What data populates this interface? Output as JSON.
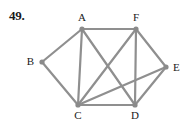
{
  "figure": {
    "number_label": "49.",
    "type": "undirected-graph",
    "width": 185,
    "height": 124,
    "background_color": "#ffffff",
    "edge_color": "#8f8f8f",
    "vertex_color": "#8a8a8a",
    "label_color": "#1a1a1a",
    "edge_width": 2.2,
    "vertex_radius": 2.6
  },
  "graph_data": {
    "type": "graph",
    "vertex_count": 6,
    "edge_count": 11,
    "vertices": [
      {
        "id": "A",
        "label": "A",
        "x": 82,
        "y": 29,
        "label_x": 82,
        "label_y": 21,
        "label_anchor": "middle"
      },
      {
        "id": "B",
        "label": "B",
        "x": 42,
        "y": 62,
        "label_x": 34,
        "label_y": 65,
        "label_anchor": "end"
      },
      {
        "id": "C",
        "label": "C",
        "x": 78,
        "y": 105,
        "label_x": 78,
        "label_y": 119,
        "label_anchor": "middle"
      },
      {
        "id": "D",
        "label": "D",
        "x": 135,
        "y": 105,
        "label_x": 135,
        "label_y": 119,
        "label_anchor": "middle"
      },
      {
        "id": "E",
        "label": "E",
        "x": 166,
        "y": 67,
        "label_x": 173,
        "label_y": 71,
        "label_anchor": "start"
      },
      {
        "id": "F",
        "label": "F",
        "x": 136,
        "y": 29,
        "label_x": 136,
        "label_y": 21,
        "label_anchor": "middle"
      }
    ],
    "edges": [
      {
        "from": "A",
        "to": "B",
        "x1": 82,
        "y1": 29,
        "x2": 42,
        "y2": 62
      },
      {
        "from": "A",
        "to": "F",
        "x1": 82,
        "y1": 29,
        "x2": 136,
        "y2": 29
      },
      {
        "from": "A",
        "to": "C",
        "x1": 82,
        "y1": 29,
        "x2": 78,
        "y2": 105
      },
      {
        "from": "A",
        "to": "D",
        "x1": 82,
        "y1": 29,
        "x2": 135,
        "y2": 105
      },
      {
        "from": "B",
        "to": "C",
        "x1": 42,
        "y1": 62,
        "x2": 78,
        "y2": 105
      },
      {
        "from": "C",
        "to": "F",
        "x1": 78,
        "y1": 105,
        "x2": 136,
        "y2": 29
      },
      {
        "from": "C",
        "to": "D",
        "x1": 78,
        "y1": 105,
        "x2": 135,
        "y2": 105
      },
      {
        "from": "C",
        "to": "E",
        "x1": 78,
        "y1": 105,
        "x2": 166,
        "y2": 67
      },
      {
        "from": "D",
        "to": "F",
        "x1": 135,
        "y1": 105,
        "x2": 136,
        "y2": 29
      },
      {
        "from": "D",
        "to": "E",
        "x1": 135,
        "y1": 105,
        "x2": 166,
        "y2": 67
      },
      {
        "from": "F",
        "to": "E",
        "x1": 136,
        "y1": 29,
        "x2": 166,
        "y2": 67
      }
    ]
  }
}
